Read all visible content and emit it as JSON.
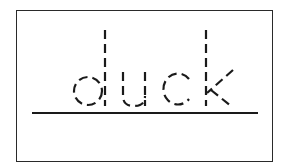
{
  "worksheet": {
    "word": "duck",
    "letters": [
      "d",
      "u",
      "c",
      "k"
    ],
    "style": "dashed tracing letters on baseline",
    "colors": {
      "ink": "#1a1a1a",
      "border": "#2a2a2a",
      "background": "#ffffff"
    }
  }
}
